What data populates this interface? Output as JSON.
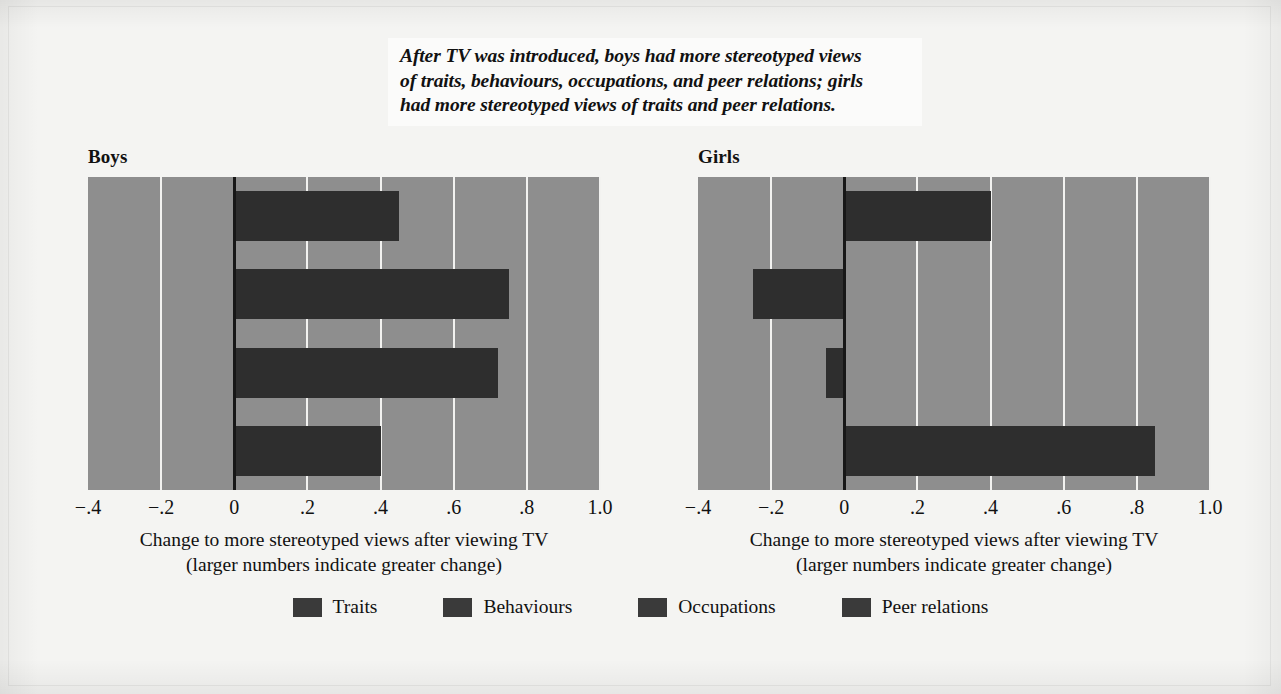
{
  "caption": {
    "lines": [
      "After TV was introduced, boys had more stereotyped views",
      "of traits, behaviours, occupations, and peer relations; girls",
      "had more stereotyped views of traits and peer relations."
    ]
  },
  "axis": {
    "title_line1": "Change to more stereotyped views after viewing TV",
    "title_line2": "(larger numbers indicate greater change)",
    "tick_labels": [
      "−.4",
      "−.2",
      "0",
      ".2",
      ".4",
      ".6",
      ".8",
      "1.0"
    ],
    "tick_values": [
      -0.4,
      -0.2,
      0,
      0.2,
      0.4,
      0.6,
      0.8,
      1.0
    ]
  },
  "panels": [
    {
      "title": "Boys"
    },
    {
      "title": "Girls"
    }
  ],
  "legend": {
    "items": [
      {
        "label": "Traits",
        "color": "#3a3a3a"
      },
      {
        "label": "Behaviours",
        "color": "#3a3a3a"
      },
      {
        "label": "Occupations",
        "color": "#3a3a3a"
      },
      {
        "label": "Peer relations",
        "color": "#3a3a3a"
      }
    ]
  },
  "colors": {
    "plot_background": "#8e8e8e",
    "bar": "#2e2e2e",
    "gridline": "#f2f2f0",
    "zero_line": "#171717",
    "page_background": "#f4f4f2",
    "text": "#111111"
  },
  "chart_data": {
    "type": "bar",
    "orientation": "horizontal",
    "title": "After TV was introduced, boys had more stereotyped views of traits, behaviours, occupations, and peer relations; girls had more stereotyped views of traits and peer relations.",
    "xlabel": "Change to more stereotyped views after viewing TV (larger numbers indicate greater change)",
    "ylabel": "",
    "xlim": [
      -0.4,
      1.0
    ],
    "xticks": [
      -0.4,
      -0.2,
      0,
      0.2,
      0.4,
      0.6,
      0.8,
      1.0
    ],
    "xticklabels": [
      "−.4",
      "−.2",
      "0",
      ".2",
      ".4",
      ".6",
      ".8",
      "1.0"
    ],
    "grid": "vertical",
    "legend_position": "bottom",
    "categories": [
      "Traits",
      "Behaviours",
      "Occupations",
      "Peer relations"
    ],
    "panels": [
      {
        "name": "Boys",
        "values": [
          0.45,
          0.75,
          0.72,
          0.4
        ]
      },
      {
        "name": "Girls",
        "values": [
          0.4,
          -0.25,
          -0.05,
          0.85
        ]
      }
    ]
  }
}
